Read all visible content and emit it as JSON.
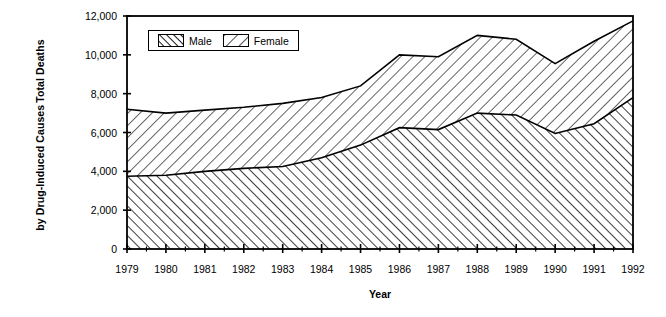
{
  "chart_data": {
    "type": "area",
    "title": "",
    "xlabel": "Year",
    "ylabel_line1": "Total Deaths",
    "ylabel_line2": "by Drug-Induced Causes",
    "categories": [
      "1979",
      "1980",
      "1981",
      "1982",
      "1983",
      "1984",
      "1985",
      "1986",
      "1987",
      "1988",
      "1989",
      "1990",
      "1991",
      "1992"
    ],
    "x": [
      1979,
      1980,
      1981,
      1982,
      1983,
      1984,
      1985,
      1986,
      1987,
      1988,
      1989,
      1990,
      1991,
      1992
    ],
    "ylim": [
      0,
      12000
    ],
    "yticks": [
      0,
      2000,
      4000,
      6000,
      8000,
      10000,
      12000
    ],
    "ytick_labels": [
      "0",
      "2,000",
      "4,000",
      "6,000",
      "8,000",
      "10,000",
      "12,000"
    ],
    "grid": false,
    "stacked": true,
    "legend_position": "top-left-inside",
    "series": [
      {
        "name": "Male",
        "hatch": "dense-forward-slash",
        "values": [
          3750,
          3800,
          4000,
          4150,
          4250,
          4700,
          5350,
          6250,
          6150,
          7000,
          6900,
          5950,
          6450,
          7800
        ]
      },
      {
        "name": "Female",
        "hatch": "sparse-back-slash",
        "values": [
          3450,
          3200,
          3150,
          3150,
          3250,
          3100,
          3050,
          3750,
          3750,
          4000,
          3900,
          3600,
          4250,
          3950
        ]
      }
    ],
    "totals": [
      7200,
      7000,
      7150,
      7300,
      7500,
      7800,
      8400,
      10000,
      9900,
      11000,
      10800,
      9550,
      10700,
      11750
    ],
    "colors": {
      "axis": "#000000",
      "series_fill": "#ffffff",
      "hatch_line": "#000000",
      "background": "#ffffff"
    }
  },
  "legend": {
    "items": [
      {
        "label": "Male",
        "swatch": "hatch-male"
      },
      {
        "label": "Female",
        "swatch": "hatch-female"
      }
    ]
  },
  "axes": {
    "x_title": "Year",
    "y_title_line1": "Total Deaths",
    "y_title_line2": "by Drug-Induced Causes"
  }
}
